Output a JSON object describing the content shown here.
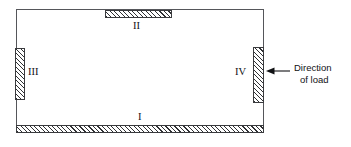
{
  "figure": {
    "type": "engineering-diagram",
    "background_color": "#ffffff",
    "outline_color": "#55565a",
    "hatch_color": "#2f3033"
  },
  "blocks": [
    {
      "id": "i",
      "label": "I",
      "position": "bottom",
      "hatched": true
    },
    {
      "id": "ii",
      "label": "II",
      "position": "top",
      "hatched": true
    },
    {
      "id": "iii",
      "label": "III",
      "position": "left",
      "hatched": true
    },
    {
      "id": "iv",
      "label": "IV",
      "position": "right",
      "hatched": true
    }
  ],
  "annotation": {
    "arrow_direction": "left",
    "caption_line_1": "Direction",
    "caption_line_2": "of load"
  }
}
